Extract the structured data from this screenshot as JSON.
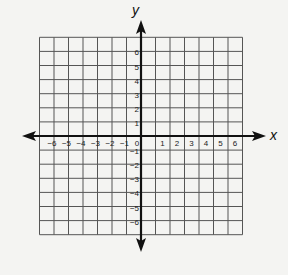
{
  "chart_data": {
    "type": "coordinate-grid",
    "title": "",
    "xlabel": "x",
    "ylabel": "y",
    "xlim": [
      -7,
      7
    ],
    "ylim": [
      -7,
      7
    ],
    "grid": true,
    "x_ticks": [
      "-6",
      "-5",
      "-4",
      "-3",
      "-2",
      "-1",
      "0",
      "1",
      "2",
      "3",
      "4",
      "5",
      "6"
    ],
    "y_ticks": [
      "6",
      "5",
      "4",
      "3",
      "2",
      "1",
      "-1",
      "-2",
      "-3",
      "-4",
      "-5",
      "-6"
    ],
    "x_tick_values": [
      -6,
      -5,
      -4,
      -3,
      -2,
      -1,
      0,
      1,
      2,
      3,
      4,
      5,
      6
    ],
    "y_tick_values": [
      6,
      5,
      4,
      3,
      2,
      1,
      -1,
      -2,
      -3,
      -4,
      -5,
      -6
    ],
    "arrows": "both axes, both directions",
    "series": []
  },
  "colors": {
    "background": "#f4f4f2",
    "grid": "#555555",
    "axis": "#111111"
  }
}
